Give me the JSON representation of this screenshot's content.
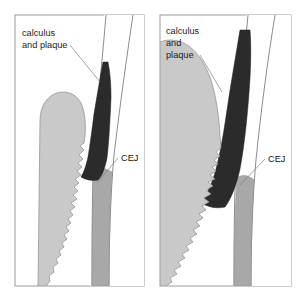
{
  "figure": {
    "panel_count": 2,
    "background_color": "#ffffff"
  },
  "palette": {
    "panel_border": "#9a9a9a",
    "panel_fill": "#ffffff",
    "gingiva_fill": "#c9c9c9",
    "gingiva_stroke": "#8c8c8c",
    "calculus_fill": "#2b2b2b",
    "calculus_stroke": "#1a1a1a",
    "bone_fill": "#6f6f6f",
    "bone_stroke": "#5a5a5a",
    "root_fill": "#a8a8a8",
    "root_stroke": "#7a7a7a",
    "enamel_fill": "#ffffff",
    "enamel_stroke": "#6e6e6e",
    "leader_line": "#7d7d7d",
    "text_color": "#1c1c1c"
  },
  "panels": [
    {
      "id": "left-panel",
      "position": "left",
      "stage": "early",
      "labels": {
        "calculus": {
          "lines": [
            "calculus",
            "and plaque"
          ],
          "line1": "calculus",
          "line2": "and plaque",
          "line3": ""
        },
        "cej": {
          "text": "CEJ"
        }
      },
      "regions": [
        {
          "name": "gingiva",
          "description": "gum tissue, light gray, scalloped inner margin"
        },
        {
          "name": "calculus-and-plaque",
          "description": "dark wedge deposit along root surface"
        },
        {
          "name": "alveolar-bone",
          "description": "dark gray bone crest"
        },
        {
          "name": "tooth-enamel",
          "description": "white crown of tooth"
        },
        {
          "name": "root-surface",
          "description": "mid gray root"
        }
      ]
    },
    {
      "id": "right-panel",
      "position": "right",
      "stage": "advanced",
      "labels": {
        "calculus": {
          "lines": [
            "calculus",
            "and",
            "plaque"
          ],
          "line1": "calculus",
          "line2": "and",
          "line3": "plaque"
        },
        "cej": {
          "text": "CEJ"
        }
      },
      "regions": [
        {
          "name": "gingiva",
          "description": "enlarged inflamed gum tissue, light gray, scalloped inner margin"
        },
        {
          "name": "calculus-and-plaque",
          "description": "thick extended dark deposit band along root surface"
        },
        {
          "name": "alveolar-bone",
          "description": "dark gray bone, reduced height"
        },
        {
          "name": "tooth-enamel",
          "description": "white crown of tooth"
        },
        {
          "name": "root-surface",
          "description": "mid gray root"
        }
      ]
    }
  ]
}
